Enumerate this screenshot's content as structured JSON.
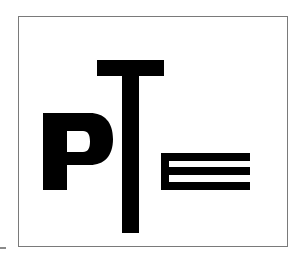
{
  "logo": {
    "text": "PTE",
    "letters": [
      "P",
      "T",
      "E"
    ],
    "ink_color": "#000000",
    "background_color": "#ffffff",
    "frame_color": "#7a7a7a"
  }
}
